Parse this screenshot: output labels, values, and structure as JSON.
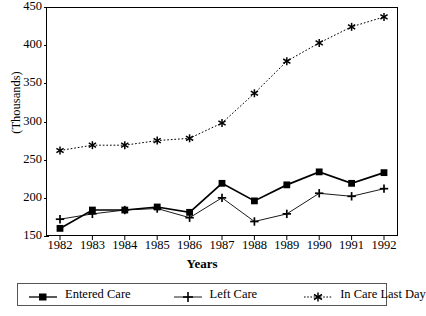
{
  "chart_data": {
    "type": "line",
    "title": "",
    "xlabel": "Years",
    "ylabel": "(Thousands)",
    "categories": [
      "1982",
      "1983",
      "1984",
      "1985",
      "1986",
      "1987",
      "1988",
      "1989",
      "1990",
      "1991",
      "1992"
    ],
    "x": [
      1982,
      1983,
      1984,
      1985,
      1986,
      1987,
      1988,
      1989,
      1990,
      1991,
      1992
    ],
    "ylim": [
      150,
      450
    ],
    "xlim": [
      1982,
      1992
    ],
    "yticks": [
      150,
      200,
      250,
      300,
      350,
      400,
      450
    ],
    "grid": false,
    "legend_position": "bottom",
    "series": [
      {
        "name": "Entered Care",
        "marker": "square",
        "linestyle": "solid",
        "color": "#000000",
        "values": [
          160,
          184,
          184,
          188,
          181,
          219,
          196,
          217,
          234,
          219,
          233
        ]
      },
      {
        "name": "Left Care",
        "marker": "plus",
        "linestyle": "solid-thin",
        "color": "#000000",
        "values": [
          172,
          179,
          184,
          186,
          174,
          200,
          169,
          179,
          206,
          202,
          212
        ]
      },
      {
        "name": "In Care Last Day",
        "marker": "asterisk",
        "linestyle": "dotted",
        "color": "#000000",
        "values": [
          262,
          269,
          269,
          275,
          278,
          298,
          337,
          379,
          403,
          424,
          437
        ]
      }
    ]
  },
  "axis": {
    "y_tick_labels": [
      "450",
      "400",
      "350",
      "300",
      "250",
      "200",
      "150"
    ],
    "x_tick_labels": [
      "1982",
      "1983",
      "1984",
      "1985",
      "1986",
      "1987",
      "1988",
      "1989",
      "1990",
      "1991",
      "1992"
    ],
    "y_title": "(Thousands)",
    "x_title": "Years"
  },
  "legend": {
    "items": [
      {
        "label": "Entered Care",
        "marker": "square-marker",
        "line": "solid"
      },
      {
        "label": "Left Care",
        "marker": "plus-marker",
        "line": "solid"
      },
      {
        "label": "In Care Last Day",
        "marker": "asterisk-marker",
        "line": "dotted"
      }
    ]
  }
}
